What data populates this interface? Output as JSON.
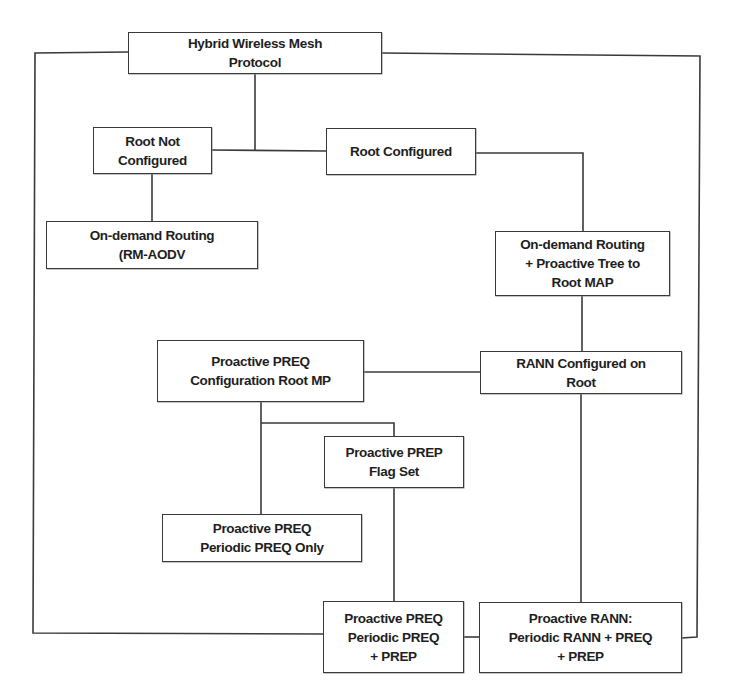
{
  "diagram": {
    "type": "flowchart",
    "colors": {
      "line": "#3a3a3a",
      "text": "#1e1e1e",
      "background": "#ffffff"
    },
    "nodes": {
      "hwmp": {
        "label": "Hybrid Wireless Mesh\nProtocol"
      },
      "root_not_configured": {
        "label": "Root Not\nConfigured"
      },
      "root_configured": {
        "label": "Root Configured"
      },
      "on_demand_rm_aodv": {
        "label": "On-demand Routing\n(RM-AODV"
      },
      "on_demand_proactive_tree": {
        "label": "On-demand Routing\n+ Proactive Tree to\nRoot MAP"
      },
      "proactive_preq_config": {
        "label": "Proactive PREQ\nConfiguration Root MP"
      },
      "rann_configured": {
        "label": "RANN Configured on\nRoot"
      },
      "proactive_prep_flag": {
        "label": "Proactive PREP\nFlag Set"
      },
      "preq_periodic_only": {
        "label": "Proactive PREQ\nPeriodic PREQ Only"
      },
      "preq_periodic_prep": {
        "label": "Proactive PREQ\nPeriodic PREQ\n+ PREP"
      },
      "rann_periodic": {
        "label": "Proactive RANN:\nPeriodic RANN + PREQ\n+ PREP"
      }
    },
    "edges": [
      {
        "from": "hwmp",
        "to": "root_not_configured"
      },
      {
        "from": "hwmp",
        "to": "root_configured"
      },
      {
        "from": "root_not_configured",
        "to": "on_demand_rm_aodv"
      },
      {
        "from": "root_configured",
        "to": "on_demand_proactive_tree"
      },
      {
        "from": "on_demand_proactive_tree",
        "to": "rann_configured"
      },
      {
        "from": "rann_configured",
        "to": "proactive_preq_config"
      },
      {
        "from": "proactive_preq_config",
        "to": "preq_periodic_only"
      },
      {
        "from": "proactive_preq_config",
        "to": "proactive_prep_flag"
      },
      {
        "from": "proactive_prep_flag",
        "to": "preq_periodic_prep"
      },
      {
        "from": "rann_configured",
        "to": "rann_periodic"
      },
      {
        "from": "preq_periodic_prep",
        "to": "rann_periodic"
      },
      {
        "from": "hwmp",
        "to": "preq_periodic_prep",
        "route": "left-border"
      },
      {
        "from": "hwmp",
        "to": "rann_periodic",
        "route": "right-border"
      }
    ]
  }
}
